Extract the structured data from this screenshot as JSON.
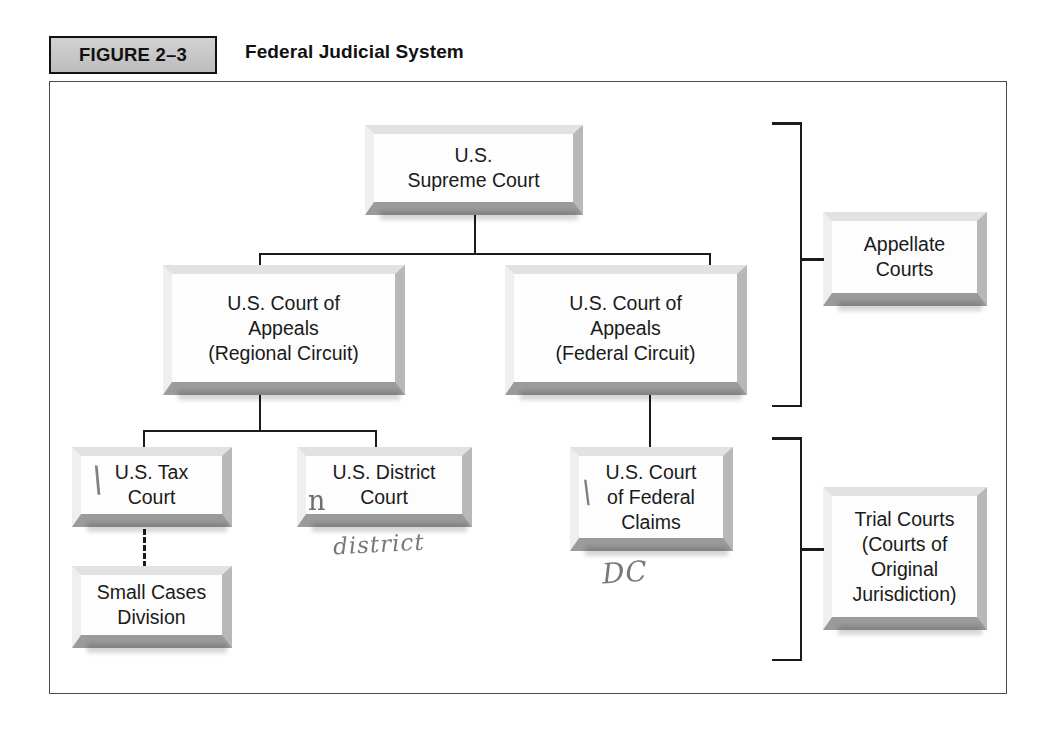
{
  "figure": {
    "tab_label": "FIGURE 2–3",
    "title": "Federal Judicial System"
  },
  "diagram": {
    "nodes": {
      "supreme_court": "U.S.\nSupreme Court",
      "appeals_regional": "U.S. Court of\nAppeals\n(Regional Circuit)",
      "appeals_federal": "U.S. Court of\nAppeals\n(Federal Circuit)",
      "tax_court": "U.S. Tax\nCourt",
      "district_court": "U.S. District\nCourt",
      "federal_claims": "U.S. Court\nof Federal\nClaims",
      "small_cases": "Small Cases\nDivision"
    },
    "tier_labels": {
      "appellate": "Appellate\nCourts",
      "trial": "Trial Courts\n(Courts of\nOriginal\nJurisdiction)"
    }
  },
  "annotations": {
    "tax_court_mark": "\\",
    "district_court_mark": "n",
    "district_word": "district",
    "federal_claims_mark": "\\",
    "dc_word": "DC"
  },
  "colors": {
    "ink": "#1b1b1b",
    "frame": "#4a4a4a",
    "tab_fill": "#c8c8c8",
    "box_face": "#fdfdfd",
    "box_shadow": "#9b9b9b",
    "pencil": "#6d6d6d"
  }
}
